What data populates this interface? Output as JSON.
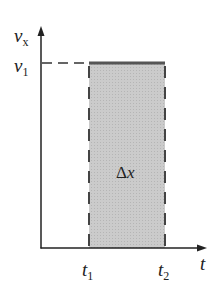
{
  "diagram": {
    "type": "velocity-time graph",
    "y_axis": {
      "symbol": "v",
      "subscript": "x"
    },
    "x_axis": {
      "symbol": "t"
    },
    "level": {
      "symbol": "v",
      "subscript": "1"
    },
    "t_start": {
      "symbol": "t",
      "subscript": "1"
    },
    "t_end": {
      "symbol": "t",
      "subscript": "2"
    },
    "area": {
      "delta": "Δ",
      "symbol": "x"
    },
    "colors": {
      "fill": "#c8c8c8",
      "line": "#555555",
      "axis": "#222222"
    }
  }
}
